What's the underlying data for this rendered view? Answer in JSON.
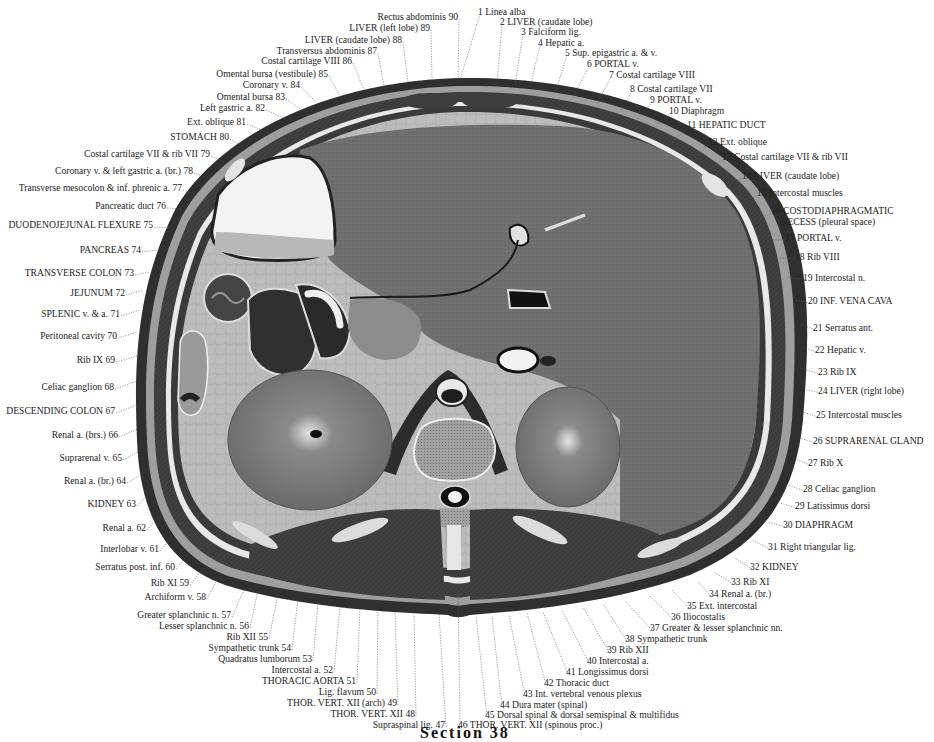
{
  "figure": {
    "caption": "Section 38",
    "colors": {
      "background": "#ffffff",
      "skin_outline": "#2a2a2a",
      "muscle_dark": "#3a3a3a",
      "liver": "#6e6e6e",
      "fat_light": "#bdbdbd",
      "stomach_lumen": "#f2f2f2",
      "bone": "#9a9a9a",
      "kidney": "#7a7a7a",
      "leader_line": "#555555"
    }
  },
  "labels": [
    {
      "n": 1,
      "text": "1 Linea alba",
      "x": 478,
      "y": 6,
      "tx": 460,
      "ty": 80
    },
    {
      "n": 2,
      "text": "2 LIVER (caudate lobe)",
      "x": 500,
      "y": 16,
      "tx": 497,
      "ty": 85
    },
    {
      "n": 3,
      "text": "3 Falciform lig.",
      "x": 521,
      "y": 26,
      "tx": 515,
      "ty": 85
    },
    {
      "n": 4,
      "text": "4 Hepatic a.",
      "x": 538,
      "y": 37,
      "tx": 530,
      "ty": 88
    },
    {
      "n": 5,
      "text": "5 Sup. epigastric a. & v.",
      "x": 565,
      "y": 47,
      "tx": 555,
      "ty": 93
    },
    {
      "n": 6,
      "text": "6 PORTAL v.",
      "x": 587,
      "y": 58,
      "tx": 573,
      "ty": 97
    },
    {
      "n": 7,
      "text": "7 Costal cartilage VIII",
      "x": 609,
      "y": 69,
      "tx": 597,
      "ty": 104
    },
    {
      "n": 8,
      "text": "8 Costal cartilage VII",
      "x": 630,
      "y": 83,
      "tx": 620,
      "ty": 112
    },
    {
      "n": 9,
      "text": "9 PORTAL v.",
      "x": 650,
      "y": 94,
      "tx": 637,
      "ty": 120
    },
    {
      "n": 10,
      "text": "10 Diaphragm",
      "x": 669,
      "y": 105,
      "tx": 651,
      "ty": 130
    },
    {
      "n": 11,
      "text": "11 HEPATIC DUCT",
      "x": 687,
      "y": 119,
      "tx": 673,
      "ty": 142
    },
    {
      "n": 12,
      "text": "12 Ext. oblique",
      "x": 708,
      "y": 136,
      "tx": 696,
      "ty": 155
    },
    {
      "n": 13,
      "text": "13 Costal cartilage VII & rib VII",
      "x": 722,
      "y": 151,
      "tx": 708,
      "ty": 170
    },
    {
      "n": 14,
      "text": "14 LIVER (caudate lobe)",
      "x": 742,
      "y": 170,
      "tx": 725,
      "ty": 183
    },
    {
      "n": 15,
      "text": "15 Intercostal muscles",
      "x": 757,
      "y": 187,
      "tx": 745,
      "ty": 200
    },
    {
      "n": 16,
      "text": "16 COSTODIAPHRAGMATIC",
      "sub": "RECESS (pleural space)",
      "x": 771,
      "y": 205,
      "tx": 760,
      "ty": 218
    },
    {
      "n": 17,
      "text": "17 PORTAL v.",
      "x": 785,
      "y": 232,
      "tx": 770,
      "ty": 240
    },
    {
      "n": 18,
      "text": "18 Rib VIII",
      "x": 795,
      "y": 251,
      "tx": 779,
      "ty": 258
    },
    {
      "n": 19,
      "text": "19 Intercostal n.",
      "x": 803,
      "y": 272,
      "tx": 788,
      "ty": 277
    },
    {
      "n": 20,
      "text": "20 INF. VENA CAVA",
      "x": 808,
      "y": 295,
      "tx": 795,
      "ty": 300
    },
    {
      "n": 21,
      "text": "21 Serratus ant.",
      "x": 813,
      "y": 322,
      "tx": 800,
      "ty": 324
    },
    {
      "n": 22,
      "text": "22 Hepatic v.",
      "x": 815,
      "y": 344,
      "tx": 802,
      "ty": 347
    },
    {
      "n": 23,
      "text": "23 Rib IX",
      "x": 818,
      "y": 366,
      "tx": 803,
      "ty": 369
    },
    {
      "n": 24,
      "text": "24 LIVER (right lobe)",
      "x": 818,
      "y": 385,
      "tx": 803,
      "ty": 389
    },
    {
      "n": 25,
      "text": "25 Intercostal muscles",
      "x": 816,
      "y": 409,
      "tx": 803,
      "ty": 412
    },
    {
      "n": 26,
      "text": "26 SUPRARENAL GLAND",
      "x": 813,
      "y": 435,
      "tx": 800,
      "ty": 438
    },
    {
      "n": 27,
      "text": "27 Rib X",
      "x": 808,
      "y": 457,
      "tx": 795,
      "ty": 459
    },
    {
      "n": 28,
      "text": "28 Celiac ganglion",
      "x": 803,
      "y": 483,
      "tx": 788,
      "ty": 485
    },
    {
      "n": 29,
      "text": "29 Latissimus dorsi",
      "x": 795,
      "y": 500,
      "tx": 780,
      "ty": 503
    },
    {
      "n": 30,
      "text": "30 DIAPHRAGM",
      "x": 783,
      "y": 519,
      "tx": 768,
      "ty": 522
    },
    {
      "n": 31,
      "text": "31 Right triangular lig.",
      "x": 768,
      "y": 541,
      "tx": 752,
      "ty": 540
    },
    {
      "n": 32,
      "text": "32 KIDNEY",
      "x": 750,
      "y": 561,
      "tx": 735,
      "ty": 558
    },
    {
      "n": 33,
      "text": "33 Rib XI",
      "x": 731,
      "y": 576,
      "tx": 714,
      "ty": 572
    },
    {
      "n": 34,
      "text": "34 Renal a. (br.)",
      "x": 709,
      "y": 588,
      "tx": 698,
      "ty": 582
    },
    {
      "n": 35,
      "text": "35 Ext. intercostal",
      "x": 687,
      "y": 600,
      "tx": 672,
      "ty": 590
    },
    {
      "n": 36,
      "text": "36 Iliocostalis",
      "x": 671,
      "y": 611,
      "tx": 650,
      "ty": 596
    },
    {
      "n": 37,
      "text": "37 Greater & lesser splanchnic nn.",
      "x": 650,
      "y": 622,
      "tx": 625,
      "ty": 601
    },
    {
      "n": 38,
      "text": "38 Sympathetic trunk",
      "x": 625,
      "y": 633,
      "tx": 603,
      "ty": 604
    },
    {
      "n": 39,
      "text": "39 Rib XII",
      "x": 607,
      "y": 644,
      "tx": 583,
      "ty": 607
    },
    {
      "n": 40,
      "text": "40 Intercostal a.",
      "x": 587,
      "y": 655,
      "tx": 562,
      "ty": 610
    },
    {
      "n": 41,
      "text": "41 Longissimus dorsi",
      "x": 566,
      "y": 666,
      "tx": 543,
      "ty": 612
    },
    {
      "n": 42,
      "text": "42 Thoracic duct",
      "x": 544,
      "y": 677,
      "tx": 527,
      "ty": 613
    },
    {
      "n": 43,
      "text": "43 Int. vertebral venous plexus",
      "x": 523,
      "y": 688,
      "tx": 509,
      "ty": 615
    },
    {
      "n": 44,
      "text": "44 Dura mater (spinal)",
      "x": 500,
      "y": 699,
      "tx": 492,
      "ty": 616
    },
    {
      "n": 45,
      "text": "45 Dorsal spinal & dorsal semispinal & multifidus",
      "x": 485,
      "y": 709,
      "tx": 476,
      "ty": 616
    },
    {
      "n": 46,
      "text": "46 THOR. VERT. XII (spinous proc.)",
      "x": 458,
      "y": 719,
      "tx": 458,
      "ty": 590
    }
  ],
  "labels_left": [
    {
      "n": 47,
      "text": "Supraspinal lig. 47",
      "x": 445,
      "y": 719,
      "tx": 439,
      "ty": 614
    },
    {
      "n": 48,
      "text": "THOR. VERT. XII 48",
      "x": 415,
      "y": 708,
      "tx": 414,
      "ty": 614
    },
    {
      "n": 49,
      "text": "THOR. VERT. XII (arch) 49",
      "x": 397,
      "y": 697,
      "tx": 395,
      "ty": 612
    },
    {
      "n": 50,
      "text": "Lig. flavum 50",
      "x": 376,
      "y": 686,
      "tx": 378,
      "ty": 610
    },
    {
      "n": 51,
      "text": "THORACIC AORTA 51",
      "x": 356,
      "y": 675,
      "tx": 360,
      "ty": 608
    },
    {
      "n": 52,
      "text": "Intercostal a. 52",
      "x": 333,
      "y": 664,
      "tx": 340,
      "ty": 605
    },
    {
      "n": 53,
      "text": "Quadratus lumborum 53",
      "x": 312,
      "y": 653,
      "tx": 318,
      "ty": 601
    },
    {
      "n": 54,
      "text": "Sympathetic trunk 54",
      "x": 291,
      "y": 642,
      "tx": 298,
      "ty": 598
    },
    {
      "n": 55,
      "text": "Rib XII 55",
      "x": 268,
      "y": 631,
      "tx": 278,
      "ty": 594
    },
    {
      "n": 56,
      "text": "Lesser splanchnic n. 56",
      "x": 249,
      "y": 620,
      "tx": 258,
      "ty": 590
    },
    {
      "n": 57,
      "text": "Greater splanchnic n. 57",
      "x": 231,
      "y": 609,
      "tx": 244,
      "ty": 590
    },
    {
      "n": 58,
      "text": "Archiform v. 58",
      "x": 206,
      "y": 591,
      "tx": 218,
      "ty": 578
    },
    {
      "n": 59,
      "text": "Rib XI 59",
      "x": 189,
      "y": 577,
      "tx": 205,
      "ty": 566
    },
    {
      "n": 60,
      "text": "Serratus post. inf. 60",
      "x": 175,
      "y": 561,
      "tx": 190,
      "ty": 552
    },
    {
      "n": 61,
      "text": "Interlobar v. 61",
      "x": 159,
      "y": 543,
      "tx": 172,
      "ty": 536
    },
    {
      "n": 62,
      "text": "Renal a. 62",
      "x": 146,
      "y": 522,
      "tx": 160,
      "ty": 515
    },
    {
      "n": 63,
      "text": "KIDNEY 63",
      "x": 136,
      "y": 498,
      "tx": 150,
      "ty": 492
    },
    {
      "n": 64,
      "text": "Renal a. (br.) 64",
      "x": 126,
      "y": 475,
      "tx": 145,
      "ty": 472
    },
    {
      "n": 65,
      "text": "Suprarenal v. 65",
      "x": 122,
      "y": 452,
      "tx": 140,
      "ty": 451
    },
    {
      "n": 66,
      "text": "Renal a. (brs.) 66",
      "x": 118,
      "y": 429,
      "tx": 138,
      "ty": 429
    },
    {
      "n": 67,
      "text": "DESCENDING COLON 67",
      "x": 115,
      "y": 405,
      "tx": 137,
      "ty": 405
    },
    {
      "n": 68,
      "text": "Celiac ganglion 68",
      "x": 114,
      "y": 381,
      "tx": 137,
      "ty": 381
    },
    {
      "n": 69,
      "text": "Rib IX 69",
      "x": 115,
      "y": 354,
      "tx": 137,
      "ty": 356
    },
    {
      "n": 70,
      "text": "Peritoneal cavity 70",
      "x": 117,
      "y": 330,
      "tx": 137,
      "ty": 332
    },
    {
      "n": 71,
      "text": "SPLENIC v. & a. 71",
      "x": 120,
      "y": 308,
      "tx": 140,
      "ty": 310
    },
    {
      "n": 72,
      "text": "JEJUNUM 72",
      "x": 125,
      "y": 287,
      "tx": 143,
      "ty": 290
    },
    {
      "n": 73,
      "text": "TRANSVERSE COLON 73",
      "x": 134,
      "y": 267,
      "tx": 150,
      "ty": 272
    },
    {
      "n": 74,
      "text": "PANCREAS 74",
      "x": 141,
      "y": 244,
      "tx": 157,
      "ty": 250
    },
    {
      "n": 75,
      "text": "DUODENOJEJUNAL FLEXURE 75",
      "x": 153,
      "y": 219,
      "tx": 168,
      "ty": 228
    },
    {
      "n": 76,
      "text": "Pancreatic duct 76",
      "x": 166,
      "y": 200,
      "tx": 182,
      "ty": 209
    },
    {
      "n": 77,
      "text": "Transverse mesocolon & inf. phrenic a. 77",
      "x": 182,
      "y": 182,
      "tx": 198,
      "ty": 195
    },
    {
      "n": 78,
      "text": "Coronary v. & left gastric a. (br.) 78",
      "x": 193,
      "y": 165,
      "tx": 208,
      "ty": 178
    },
    {
      "n": 79,
      "text": "Costal cartilage VII & rib VII 79",
      "x": 210,
      "y": 148,
      "tx": 225,
      "ty": 162
    },
    {
      "n": 80,
      "text": "STOMACH 80",
      "x": 229,
      "y": 131,
      "tx": 242,
      "ty": 146
    },
    {
      "n": 81,
      "text": "Ext. oblique 81",
      "x": 246,
      "y": 116,
      "tx": 262,
      "ty": 130
    },
    {
      "n": 82,
      "text": "Left gastric a. 82",
      "x": 265,
      "y": 102,
      "tx": 283,
      "ty": 118
    },
    {
      "n": 83,
      "text": "Omental bursa 83",
      "x": 285,
      "y": 91,
      "tx": 302,
      "ty": 110
    },
    {
      "n": 84,
      "text": "Coronary v. 84",
      "x": 300,
      "y": 79,
      "tx": 316,
      "ty": 102
    },
    {
      "n": 85,
      "text": "Omental bursa (vestibule) 85",
      "x": 328,
      "y": 68,
      "tx": 340,
      "ty": 96
    },
    {
      "n": 86,
      "text": "Costal cartilage VIII 86",
      "x": 352,
      "y": 55,
      "tx": 364,
      "ty": 90
    },
    {
      "n": 87,
      "text": "Transversus abdominis 87",
      "x": 377,
      "y": 45,
      "tx": 384,
      "ty": 86
    },
    {
      "n": 88,
      "text": "LIVER (caudate lobe) 88",
      "x": 402,
      "y": 34,
      "tx": 408,
      "ty": 82
    },
    {
      "n": 89,
      "text": "LIVER (left lobe) 89",
      "x": 430,
      "y": 22,
      "tx": 432,
      "ty": 80
    },
    {
      "n": 90,
      "text": "Rectus abdominis 90",
      "x": 458,
      "y": 11,
      "tx": 458,
      "ty": 80
    }
  ]
}
